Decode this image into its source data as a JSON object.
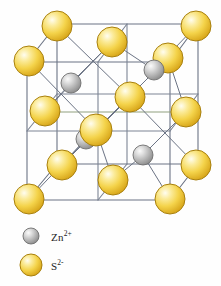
{
  "figure": {
    "background": "#FEFEFE"
  },
  "colors": {
    "sulfide_fill_light": "#FDF6C8",
    "sulfide_fill_mid": "#F5D94B",
    "sulfide_fill_dark": "#D9A81C",
    "sulfide_stroke": "#A8800E",
    "zinc_fill_light": "#F2F2F2",
    "zinc_fill_mid": "#B8B8B8",
    "zinc_fill_dark": "#8A8A8A",
    "zinc_stroke": "#6E6E6E",
    "edge_line": "#6B7384",
    "bond_line": "#6B7384",
    "text": "#1C1C1C"
  },
  "cell": {
    "edge_stroke_width": 1.1,
    "front_face": [
      [
        25,
        62
      ],
      [
        170,
        62
      ],
      [
        170,
        202
      ],
      [
        25,
        202
      ]
    ],
    "back_offset": [
      28,
      -38
    ]
  },
  "legend": {
    "items": [
      {
        "id": "zinc-ion",
        "symbol": "Zn",
        "charge": "2+",
        "label": "Zn2+",
        "species": "zinc",
        "radius_px": 8,
        "swatch_x": 30,
        "swatch_y": 232
      },
      {
        "id": "sulfide-ion",
        "symbol": "S",
        "charge": "2-",
        "label": "S2-",
        "species": "sulfide",
        "radius_px": 11,
        "swatch_x": 30,
        "swatch_y": 261
      }
    ]
  },
  "atoms": {
    "sulfide": [
      {
        "id": "s-corner-front-top-left",
        "x": 29,
        "y": 61,
        "r": 15,
        "site": "corner"
      },
      {
        "id": "s-corner-back-top-left",
        "x": 57,
        "y": 26,
        "r": 15,
        "site": "corner"
      },
      {
        "id": "s-face-top",
        "x": 112,
        "y": 42,
        "r": 15,
        "site": "face-center"
      },
      {
        "id": "s-corner-back-top-right",
        "x": 196,
        "y": 26,
        "r": 15,
        "site": "corner"
      },
      {
        "id": "s-face-right-upper",
        "x": 168,
        "y": 58,
        "r": 15,
        "site": "face-center"
      },
      {
        "id": "s-face-left",
        "x": 45,
        "y": 111,
        "r": 15,
        "site": "face-center"
      },
      {
        "id": "s-face-back",
        "x": 130,
        "y": 97,
        "r": 15,
        "site": "face-center"
      },
      {
        "id": "s-face-right",
        "x": 186,
        "y": 112,
        "r": 15,
        "site": "face-center"
      },
      {
        "id": "s-face-front",
        "x": 96,
        "y": 130,
        "r": 16,
        "site": "face-center"
      },
      {
        "id": "s-corner-back-bottom-left",
        "x": 62,
        "y": 165,
        "r": 15,
        "site": "corner"
      },
      {
        "id": "s-face-bottom",
        "x": 113,
        "y": 180,
        "r": 15,
        "site": "face-center"
      },
      {
        "id": "s-corner-back-bottom-right",
        "x": 196,
        "y": 165,
        "r": 15,
        "site": "corner"
      },
      {
        "id": "s-corner-front-bottom-left",
        "x": 29,
        "y": 199,
        "r": 15,
        "site": "corner"
      },
      {
        "id": "s-corner-front-bottom-right",
        "x": 170,
        "y": 199,
        "r": 15,
        "site": "corner"
      }
    ],
    "zinc": [
      {
        "id": "zn-upper-left",
        "x": 71,
        "y": 83,
        "r": 10,
        "site": "tetrahedral-hole"
      },
      {
        "id": "zn-upper-right",
        "x": 154,
        "y": 70,
        "r": 10,
        "site": "tetrahedral-hole"
      },
      {
        "id": "zn-lower-left",
        "x": 86,
        "y": 139,
        "r": 10,
        "site": "tetrahedral-hole"
      },
      {
        "id": "zn-lower-right",
        "x": 143,
        "y": 155,
        "r": 10,
        "site": "tetrahedral-hole"
      }
    ]
  },
  "counts": {
    "sulfide_drawn": 14,
    "zinc_drawn": 4
  }
}
